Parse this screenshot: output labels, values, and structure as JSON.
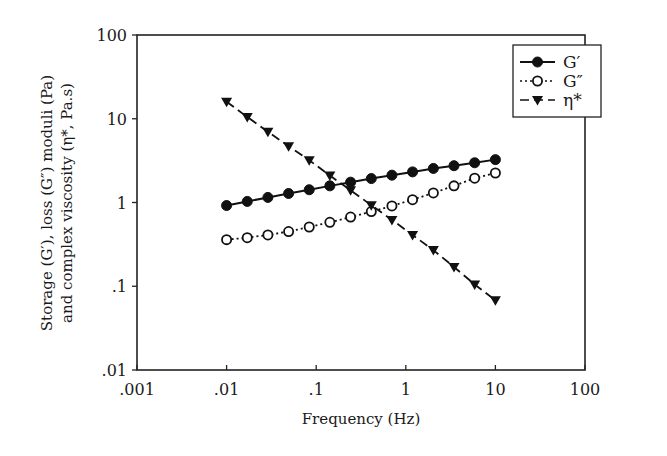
{
  "chart_data": {
    "type": "line",
    "title": "",
    "xlabel": "Frequency (Hz)",
    "ylabel_line1": "Storage (G′), loss (G″) moduli (Pa)",
    "ylabel_line2": "and complex viscosity (η*, Pa.s)",
    "xscale": "log",
    "yscale": "log",
    "xlim": [
      0.001,
      100
    ],
    "ylim": [
      0.01,
      100
    ],
    "x_ticks": [
      ".001",
      ".01",
      ".1",
      "1",
      "10",
      "100"
    ],
    "y_ticks": [
      ".01",
      ".1",
      "1",
      "10",
      "100"
    ],
    "grid": false,
    "legend_position": "upper right",
    "x": [
      0.01,
      0.017,
      0.0289,
      0.0492,
      0.0836,
      0.142,
      0.242,
      0.412,
      0.7,
      1.19,
      2.03,
      3.45,
      5.87,
      10
    ],
    "series": [
      {
        "name": "G′",
        "marker": "filled-circle",
        "line": "solid",
        "values": [
          0.92,
          1.03,
          1.15,
          1.28,
          1.42,
          1.58,
          1.75,
          1.93,
          2.12,
          2.32,
          2.55,
          2.75,
          2.98,
          3.25
        ]
      },
      {
        "name": "G″",
        "marker": "open-circle",
        "line": "dotted",
        "values": [
          0.36,
          0.38,
          0.41,
          0.45,
          0.51,
          0.58,
          0.67,
          0.78,
          0.91,
          1.08,
          1.3,
          1.58,
          1.95,
          2.25
        ]
      },
      {
        "name": "η*",
        "marker": "filled-triangle-down",
        "line": "dashed",
        "values": [
          16.0,
          10.5,
          7.0,
          4.7,
          3.2,
          2.1,
          1.4,
          0.93,
          0.62,
          0.41,
          0.27,
          0.17,
          0.105,
          0.068
        ]
      }
    ]
  }
}
